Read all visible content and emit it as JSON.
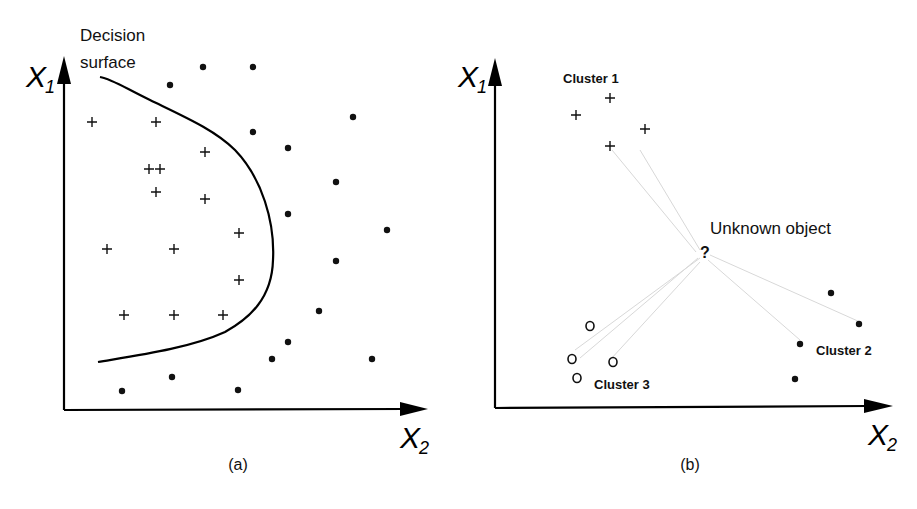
{
  "panel_a": {
    "caption": "(a)",
    "annotation_line1": "Decision",
    "annotation_line2": "surface",
    "y_axis": {
      "label": "X",
      "sub": "1"
    },
    "x_axis": {
      "label": "X",
      "sub": "2"
    },
    "plus_points": [
      [
        92,
        122
      ],
      [
        156,
        122
      ],
      [
        205,
        152
      ],
      [
        149,
        169
      ],
      [
        160,
        169
      ],
      [
        156,
        192
      ],
      [
        205,
        199
      ],
      [
        239,
        233
      ],
      [
        107,
        249
      ],
      [
        174,
        249
      ],
      [
        239,
        280
      ],
      [
        124,
        315
      ],
      [
        174,
        315
      ],
      [
        223,
        315
      ]
    ],
    "dot_points": [
      [
        203,
        67
      ],
      [
        253,
        67
      ],
      [
        170,
        85
      ],
      [
        353,
        117
      ],
      [
        253,
        132
      ],
      [
        288,
        148
      ],
      [
        336,
        182
      ],
      [
        288,
        214
      ],
      [
        387,
        230
      ],
      [
        336,
        261
      ],
      [
        319,
        311
      ],
      [
        288,
        342
      ],
      [
        272,
        359
      ],
      [
        372,
        359
      ],
      [
        172,
        377
      ],
      [
        122,
        391
      ],
      [
        238,
        390
      ]
    ]
  },
  "panel_b": {
    "caption": "(b)",
    "annotation": "Unknown object",
    "question_mark": "?",
    "y_axis": {
      "label": "X",
      "sub": "1"
    },
    "x_axis": {
      "label": "X",
      "sub": "2"
    },
    "clusters": [
      {
        "label": "Cluster 1",
        "symbol": "plus",
        "points": [
          [
            610,
            98
          ],
          [
            576,
            115
          ],
          [
            645,
            129
          ],
          [
            610,
            146
          ]
        ]
      },
      {
        "label": "Cluster 2",
        "symbol": "dot",
        "points": [
          [
            831,
            293
          ],
          [
            859,
            324
          ],
          [
            800,
            344
          ],
          [
            795,
            379
          ]
        ]
      },
      {
        "label": "Cluster 3",
        "symbol": "circle",
        "points": [
          [
            590,
            326
          ],
          [
            572,
            359
          ],
          [
            613,
            362
          ],
          [
            577,
            378
          ]
        ]
      }
    ]
  }
}
